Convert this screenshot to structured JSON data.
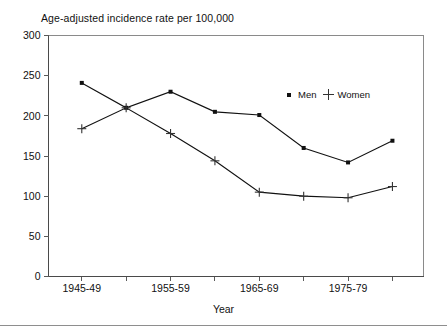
{
  "chart_data": {
    "type": "line",
    "title": "Age-adjusted incidence rate per 100,000",
    "xlabel": "Year",
    "ylabel": "",
    "categories": [
      "1945-49",
      "1950-54",
      "1955-59",
      "1960-64",
      "1965-69",
      "1970-74",
      "1975-79",
      "1980-84"
    ],
    "visible_tick_labels": [
      "1945-49",
      "",
      "1955-59",
      "",
      "1965-69",
      "",
      "1975-79",
      ""
    ],
    "series": [
      {
        "name": "Men",
        "marker": "filled-square",
        "values": [
          241,
          210,
          230,
          205,
          201,
          160,
          142,
          169
        ]
      },
      {
        "name": "Women",
        "marker": "plus",
        "values": [
          184,
          210,
          178,
          144,
          105,
          100,
          98,
          112
        ]
      }
    ],
    "ylim": [
      0,
      300
    ],
    "yticks": [
      0,
      50,
      100,
      150,
      200,
      250,
      300
    ],
    "ytick_labels": [
      "0",
      "50",
      "100",
      "150",
      "200",
      "250",
      "300"
    ],
    "grid": false,
    "legend_position": "upper-right-inside"
  },
  "legend": {
    "men_label": "Men",
    "women_label": "Women"
  },
  "colors": {
    "series_line": "#111111",
    "frame": "#8a8a8a",
    "axis": "#4a4a4a",
    "background": "#ffffff"
  }
}
